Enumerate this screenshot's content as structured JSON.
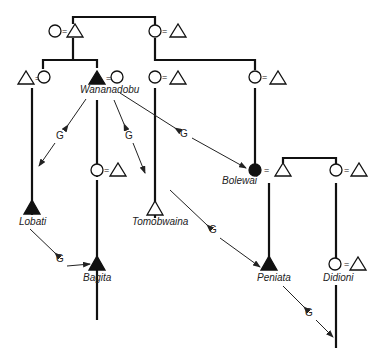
{
  "diagram": {
    "type": "kinship-chart",
    "relation_label": "G",
    "marriage_symbol": "=",
    "symbols": {
      "male": "triangle",
      "female": "circle",
      "ego_highlight": "filled"
    },
    "named_persons": [
      {
        "name": "Wananadobu",
        "sex": "male",
        "highlighted": true
      },
      {
        "name": "Lobati",
        "sex": "male",
        "highlighted": true
      },
      {
        "name": "Bagita",
        "sex": "male",
        "highlighted": true
      },
      {
        "name": "Tomobwaina",
        "sex": "male",
        "highlighted": false
      },
      {
        "name": "Bolewai",
        "sex": "female",
        "highlighted": true
      },
      {
        "name": "Peniata",
        "sex": "male",
        "highlighted": true
      },
      {
        "name": "Didioni",
        "sex": "female",
        "highlighted": false
      }
    ],
    "labels": {
      "wananadobu": "Wananadobu",
      "lobati": "Lobati",
      "bagita": "Bagita",
      "tomobwaina": "Tomobwaina",
      "bolewai": "Bolewai",
      "peniata": "Peniata",
      "didioni": "Didioni",
      "g": "G",
      "eq": "="
    },
    "g_links": [
      {
        "from": "Wananadobu",
        "to": "Lobati",
        "label": "G"
      },
      {
        "from": "Wananadobu",
        "to": "Tomobwaina",
        "label": "G"
      },
      {
        "from": "Wananadobu",
        "to": "Bolewai",
        "label": "G"
      },
      {
        "from": "Lobati",
        "to": "Bagita",
        "label": "G"
      },
      {
        "from": "Tomobwaina",
        "to": "Peniata",
        "label": "G"
      },
      {
        "from": "Peniata",
        "to": "Didioni's child",
        "label": "G"
      }
    ]
  }
}
